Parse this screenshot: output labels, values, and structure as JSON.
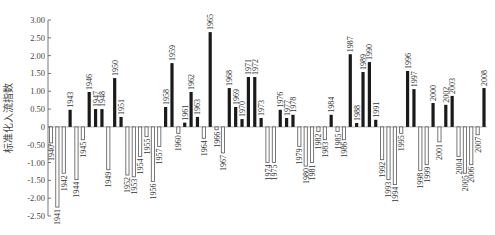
{
  "chart_data": {
    "type": "bar",
    "title": "",
    "xlabel": "",
    "ylabel": "标准化入流指数",
    "ylim": [
      -2.5,
      3.0
    ],
    "yticks": [
      "3.00",
      "2.50",
      "2.00",
      "1.50",
      "1.00",
      "0.50",
      "0",
      "-0.50",
      "-1.00",
      "-1.50",
      "-2.00",
      "-2.50"
    ],
    "ytick_values": [
      3.0,
      2.5,
      2.0,
      1.5,
      1.0,
      0.5,
      0,
      -0.5,
      -1.0,
      -1.5,
      -2.0,
      -2.5
    ],
    "grid": false,
    "legend": "none",
    "positive_color": "#1a1a1a",
    "negative_fill": "#ffffff",
    "negative_stroke": "#555555",
    "categories": [
      "1940",
      "1941",
      "1942",
      "1943",
      "1944",
      "1945",
      "1946",
      "1947",
      "1948",
      "1949",
      "1950",
      "1951",
      "1952",
      "1953",
      "1954",
      "1955",
      "1956",
      "1957",
      "1958",
      "1959",
      "1960",
      "1961",
      "1962",
      "1963",
      "1964",
      "1965",
      "1966",
      "1967",
      "1968",
      "1969",
      "1970",
      "1971",
      "1972",
      "1973",
      "1974",
      "1975",
      "1976",
      "1977",
      "1978",
      "1979",
      "1980",
      "1981",
      "1982",
      "1983",
      "1984",
      "1985",
      "1986",
      "1987",
      "1988",
      "1989",
      "1990",
      "1991",
      "1992",
      "1993",
      "1994",
      "1995",
      "1996",
      "1997",
      "1998",
      "1999",
      "2000",
      "2001",
      "2002",
      "2003",
      "2004",
      "2005",
      "2006",
      "2007",
      "2008"
    ],
    "values": [
      -0.45,
      -2.25,
      -1.3,
      0.48,
      -1.48,
      -0.36,
      0.98,
      0.5,
      0.5,
      -1.2,
      1.37,
      0.28,
      -1.35,
      -1.4,
      -0.83,
      -0.27,
      -1.53,
      -0.55,
      0.56,
      1.79,
      -0.18,
      0.12,
      0.98,
      0.28,
      -0.32,
      2.66,
      -0.08,
      -0.73,
      1.09,
      0.56,
      0.22,
      1.4,
      1.4,
      0.25,
      -1.0,
      -1.0,
      0.48,
      0.25,
      0.34,
      -0.55,
      -1.1,
      -1.0,
      -0.13,
      -0.36,
      0.34,
      -0.13,
      -0.36,
      2.04,
      0.11,
      1.54,
      1.82,
      0.2,
      -0.92,
      -1.48,
      -1.62,
      -0.18,
      1.57,
      1.06,
      -1.23,
      -1.06,
      0.67,
      -0.42,
      0.62,
      0.87,
      -0.83,
      -1.3,
      -1.06,
      -0.22,
      1.09
    ]
  }
}
